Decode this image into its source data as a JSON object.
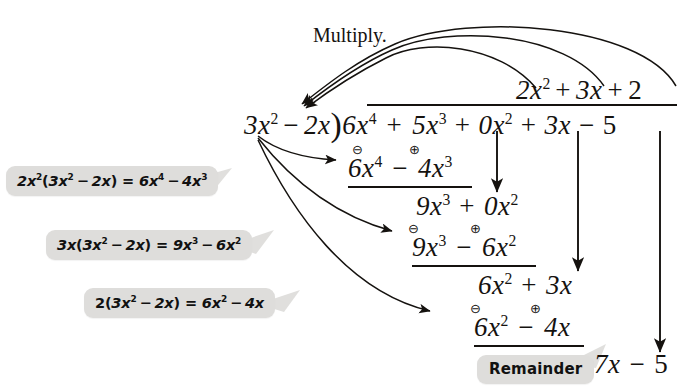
{
  "figure": {
    "caption": "Multiply.",
    "background_color": "#ffffff",
    "ink_color": "#15120f",
    "callout_background": "#dedddb"
  },
  "division": {
    "quotient": {
      "t1": "2x",
      "t1_exp": "2",
      "op1": "+",
      "t2": "3x",
      "op2": "+",
      "t3": "2"
    },
    "divisor": {
      "t1": "3x",
      "t1_exp": "2",
      "op": "−",
      "t2": "2x",
      "bracket": ")"
    },
    "dividend": {
      "t1": "6x",
      "t1_exp": "4",
      "op1": "+",
      "t2": "5x",
      "t2_exp": "3",
      "op2": "+",
      "t3": "0x",
      "t3_exp": "2",
      "op3": "+",
      "t4": "3x",
      "op4": "−",
      "t5": "5"
    },
    "step1_subtract": {
      "t1": "6x",
      "t1_exp": "4",
      "op": "−",
      "t2": "4x",
      "t2_exp": "3",
      "sign_left": "⊖",
      "sign_right": "⊕"
    },
    "step1_result": {
      "t1": "9x",
      "t1_exp": "3",
      "op": "+",
      "t2": "0x",
      "t2_exp": "2"
    },
    "step2_subtract": {
      "t1": "9x",
      "t1_exp": "3",
      "op": "−",
      "t2": "6x",
      "t2_exp": "2",
      "sign_left": "⊖",
      "sign_right": "⊕"
    },
    "step2_result": {
      "t1": "6x",
      "t1_exp": "2",
      "op": "+",
      "t2": "3x"
    },
    "step3_subtract": {
      "t1": "6x",
      "t1_exp": "2",
      "op": "−",
      "t2": "4x",
      "sign_left": "⊖",
      "sign_right": "⊕"
    },
    "remainder_value": {
      "t1": "7x",
      "op": "−",
      "t2": "5"
    }
  },
  "callouts": [
    {
      "id": "callout-1",
      "coef": "2x",
      "coef_exp": "2",
      "group_a": "3x",
      "group_a_exp": "2",
      "group_op": "−",
      "group_b": "2x",
      "equals": "=",
      "res_a": "6x",
      "res_a_exp": "4",
      "res_op": "−",
      "res_b": "4x",
      "res_b_exp": "3"
    },
    {
      "id": "callout-2",
      "coef": "3x",
      "coef_exp": "",
      "group_a": "3x",
      "group_a_exp": "2",
      "group_op": "−",
      "group_b": "2x",
      "equals": "=",
      "res_a": "9x",
      "res_a_exp": "3",
      "res_op": "−",
      "res_b": "6x",
      "res_b_exp": "2"
    },
    {
      "id": "callout-3",
      "coef": "2",
      "coef_exp": "",
      "group_a": "3x",
      "group_a_exp": "2",
      "group_op": "−",
      "group_b": "2x",
      "equals": "=",
      "res_a": "6x",
      "res_a_exp": "2",
      "res_op": "−",
      "res_b": "4x",
      "res_b_exp": ""
    }
  ],
  "remainder_label": "Remainder",
  "annotations": {
    "multiply_arrows_count": 3,
    "bring_down_arrows_count": 3,
    "callout_pointer_arrows_count": 3
  }
}
